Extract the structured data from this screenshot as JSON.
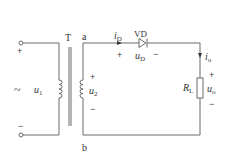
{
  "diagram": {
    "type": "half-wave rectifier circuit",
    "transformer": {
      "label": "T"
    },
    "nodes": {
      "top": "a",
      "bottom": "b"
    },
    "primary": {
      "symbol": "~",
      "voltage_var": "u",
      "voltage_sub": "1",
      "plus": "+",
      "minus": "−"
    },
    "secondary": {
      "voltage_var": "u",
      "voltage_sub": "2",
      "plus": "+",
      "minus": "−"
    },
    "diode": {
      "label": "VD",
      "current_var": "i",
      "current_sub": "D",
      "voltage_var": "u",
      "voltage_sub": "D",
      "plus": "+",
      "minus": "−"
    },
    "load": {
      "resistor_var": "R",
      "resistor_sub": "L",
      "current_var": "i",
      "current_sub": "o",
      "voltage_var": "u",
      "voltage_sub": "o",
      "plus": "+",
      "minus": "−"
    },
    "colors": {
      "wire": "#6b6b6b",
      "text": "#333333"
    }
  }
}
